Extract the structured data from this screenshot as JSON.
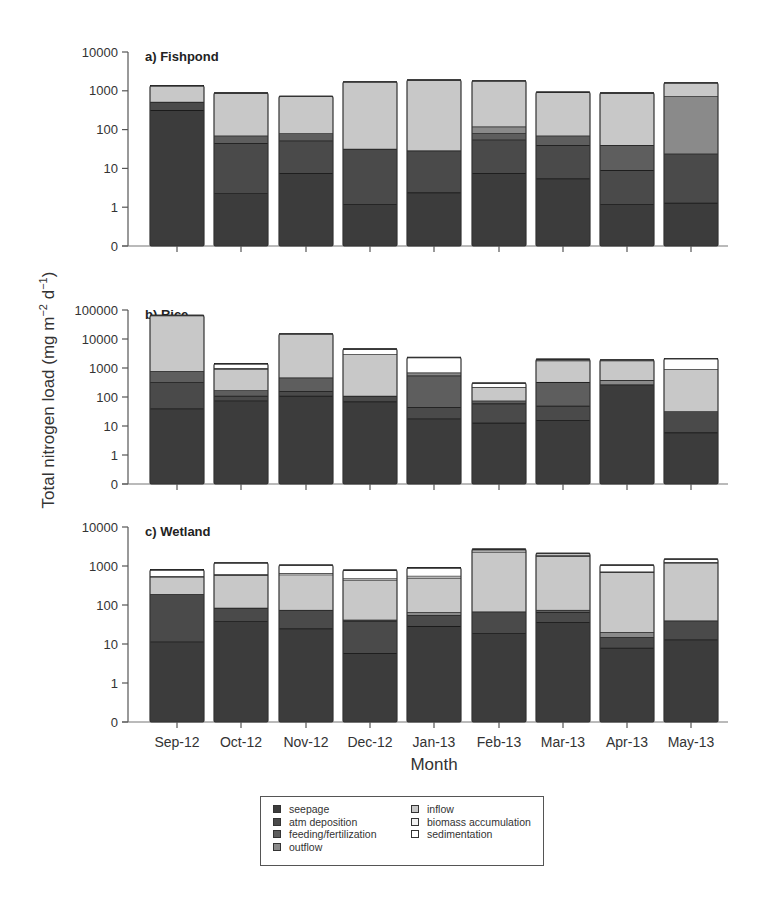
{
  "chart_data": {
    "type": "bar",
    "stacked": true,
    "yscale": "log",
    "ylabel": "Total nitrogen load (mg m-2 d-1)",
    "xlabel": "Month",
    "categories": [
      "Sep-12",
      "Oct-12",
      "Nov-12",
      "Dec-12",
      "Jan-13",
      "Feb-13",
      "Mar-13",
      "Apr-13",
      "May-13"
    ],
    "legend": [
      "seepage",
      "atm deposition",
      "feeding/fertilization",
      "outflow",
      "inflow",
      "biomass accumulation",
      "sedimentation"
    ],
    "legend_colors": [
      "#3c3c3c",
      "#4a4a4a",
      "#5e5e5e",
      "#8a8a8a",
      "#c8c8c8",
      "#f2f2f2",
      "#ffffff"
    ],
    "panels": [
      {
        "title": "a) Fishpond",
        "yticks": [
          "0",
          "1",
          "10",
          "100",
          "1000",
          "10000"
        ],
        "ylim": [
          0.1,
          10000
        ],
        "cumulative_tops": [
          [
            320,
            520,
            520,
            520,
            1350,
            1350,
            1350
          ],
          [
            2.3,
            45,
            70,
            70,
            880,
            880,
            880
          ],
          [
            7.5,
            52,
            80,
            80,
            720,
            720,
            720
          ],
          [
            1.2,
            32,
            32,
            32,
            1700,
            1700,
            1700
          ],
          [
            2.4,
            29,
            29,
            29,
            1900,
            1900,
            1900
          ],
          [
            7.5,
            55,
            80,
            120,
            1800,
            1800,
            1800
          ],
          [
            5.5,
            40,
            70,
            70,
            920,
            920,
            920
          ],
          [
            1.2,
            9,
            40,
            40,
            880,
            880,
            880
          ],
          [
            1.3,
            24,
            24,
            720,
            1600,
            1600,
            1600
          ]
        ]
      },
      {
        "title": "b) Rice",
        "yticks": [
          "0",
          "1",
          "10",
          "100",
          "1000",
          "10000",
          "100000"
        ],
        "ylim": [
          0.1,
          100000
        ],
        "cumulative_tops": [
          [
            40,
            320,
            780,
            780,
            65000,
            65000,
            65000
          ],
          [
            75,
            110,
            170,
            170,
            900,
            1000,
            1400
          ],
          [
            110,
            160,
            470,
            470,
            15000,
            15000,
            15000
          ],
          [
            70,
            110,
            110,
            110,
            3000,
            3000,
            4500
          ],
          [
            18,
            45,
            550,
            700,
            700,
            700,
            2300
          ],
          [
            13,
            60,
            75,
            75,
            220,
            220,
            300
          ],
          [
            16,
            50,
            330,
            330,
            1800,
            1900,
            2000
          ],
          [
            270,
            270,
            270,
            380,
            1800,
            1900,
            1900
          ],
          [
            6,
            32,
            32,
            32,
            900,
            900,
            2100
          ]
        ]
      },
      {
        "title": "c) Wetland",
        "yticks": [
          "0",
          "1",
          "10",
          "100",
          "1000",
          "10000"
        ],
        "ylim": [
          0.1,
          10000
        ],
        "cumulative_tops": [
          [
            11.5,
            190,
            190,
            190,
            530,
            550,
            800
          ],
          [
            38,
            85,
            85,
            85,
            580,
            620,
            1200
          ],
          [
            25,
            75,
            75,
            75,
            600,
            650,
            1050
          ],
          [
            5.8,
            38,
            42,
            42,
            440,
            480,
            780
          ],
          [
            29,
            55,
            55,
            65,
            500,
            560,
            900
          ],
          [
            19,
            68,
            68,
            68,
            2300,
            2500,
            2700
          ],
          [
            36,
            65,
            75,
            75,
            1800,
            1900,
            2100
          ],
          [
            8,
            15,
            15,
            20,
            700,
            720,
            1050
          ],
          [
            13,
            40,
            40,
            40,
            1200,
            1250,
            1500
          ]
        ]
      }
    ]
  }
}
